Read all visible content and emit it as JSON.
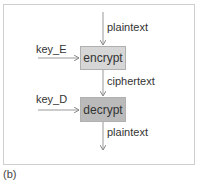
{
  "diagram": {
    "nodes": [
      {
        "id": "encrypt",
        "label": "encrypt",
        "fill": "#d6d6d6"
      },
      {
        "id": "decrypt",
        "label": "decrypt",
        "fill": "#bababa"
      }
    ],
    "edges": [
      {
        "from": "input",
        "to": "encrypt",
        "label": "plaintext"
      },
      {
        "from": "key_E",
        "to": "encrypt",
        "label": "key_E"
      },
      {
        "from": "encrypt",
        "to": "decrypt",
        "label": "ciphertext"
      },
      {
        "from": "key_D",
        "to": "decrypt",
        "label": "key_D"
      },
      {
        "from": "decrypt",
        "to": "output",
        "label": "plaintext"
      }
    ],
    "caption": "(b)"
  }
}
